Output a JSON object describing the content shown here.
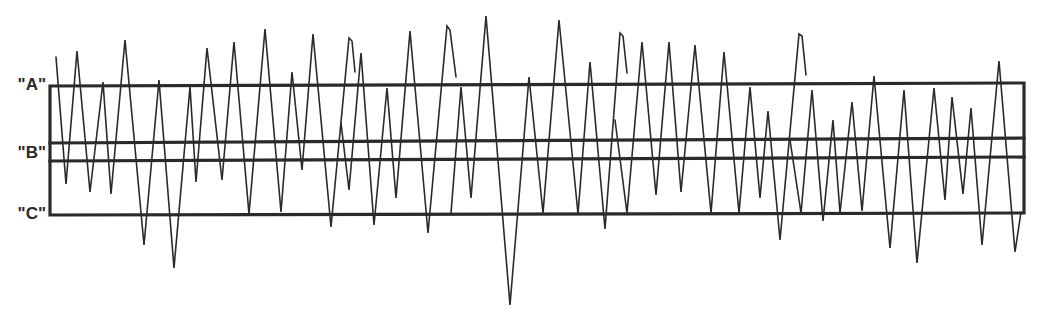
{
  "diagram": {
    "type": "hand-drawn waveform with reference lines",
    "stroke_color": "#2a2a2a",
    "labels": [
      {
        "text": "\"A\"",
        "y": 84
      },
      {
        "text": "\"B\"",
        "y": 152
      },
      {
        "text": "\"C\"",
        "y": 213
      }
    ],
    "box": {
      "left": 50,
      "right": 1024,
      "top_left": 86,
      "top_right": 83,
      "bottom_left": 215,
      "bottom_right": 213
    },
    "b_lines": [
      {
        "y_left": 143,
        "y_right": 138
      },
      {
        "y_left": 161,
        "y_right": 157
      }
    ],
    "waveform_strokes": [
      [
        [
          56,
          57
        ],
        [
          66,
          184
        ],
        [
          77,
          51
        ],
        [
          90,
          192
        ],
        [
          103,
          82
        ],
        [
          111,
          194
        ],
        [
          125,
          40
        ],
        [
          144,
          245
        ],
        [
          159,
          80
        ],
        [
          174,
          268
        ],
        [
          190,
          87
        ],
        [
          196,
          182
        ],
        [
          207,
          48
        ],
        [
          222,
          180
        ],
        [
          234,
          42
        ],
        [
          249,
          214
        ],
        [
          265,
          29
        ],
        [
          281,
          212
        ],
        [
          292,
          72
        ],
        [
          302,
          170
        ],
        [
          313,
          34
        ],
        [
          331,
          227
        ],
        [
          349,
          38
        ],
        [
          352,
          41
        ],
        [
          355,
          72
        ]
      ],
      [
        [
          341,
          123
        ],
        [
          349,
          190
        ],
        [
          361,
          53
        ],
        [
          374,
          225
        ],
        [
          387,
          88
        ],
        [
          396,
          198
        ],
        [
          410,
          31
        ],
        [
          428,
          233
        ],
        [
          447,
          26
        ],
        [
          450,
          30
        ],
        [
          456,
          77
        ]
      ],
      [
        [
          451,
          213
        ],
        [
          461,
          87
        ],
        [
          471,
          198
        ],
        [
          486,
          16
        ],
        [
          510,
          305
        ],
        [
          529,
          77
        ],
        [
          543,
          213
        ],
        [
          559,
          20
        ],
        [
          578,
          214
        ],
        [
          590,
          62
        ],
        [
          605,
          229
        ],
        [
          620,
          33
        ],
        [
          623,
          36
        ],
        [
          627,
          73
        ]
      ],
      [
        [
          615,
          120
        ],
        [
          627,
          213
        ],
        [
          642,
          42
        ],
        [
          656,
          195
        ],
        [
          669,
          42
        ],
        [
          681,
          192
        ],
        [
          695,
          45
        ],
        [
          711,
          213
        ],
        [
          724,
          52
        ],
        [
          739,
          213
        ],
        [
          750,
          87
        ],
        [
          760,
          198
        ],
        [
          768,
          111
        ],
        [
          780,
          240
        ],
        [
          799,
          34
        ],
        [
          802,
          36
        ],
        [
          806,
          75
        ]
      ],
      [
        [
          790,
          140
        ],
        [
          801,
          213
        ],
        [
          812,
          90
        ],
        [
          823,
          221
        ],
        [
          833,
          120
        ],
        [
          840,
          213
        ],
        [
          852,
          102
        ],
        [
          862,
          211
        ],
        [
          874,
          76
        ],
        [
          890,
          248
        ],
        [
          904,
          90
        ],
        [
          917,
          263
        ],
        [
          934,
          88
        ],
        [
          945,
          200
        ],
        [
          952,
          97
        ],
        [
          963,
          194
        ],
        [
          971,
          108
        ],
        [
          982,
          245
        ],
        [
          999,
          61
        ],
        [
          1015,
          252
        ],
        [
          1021,
          212
        ]
      ]
    ]
  }
}
